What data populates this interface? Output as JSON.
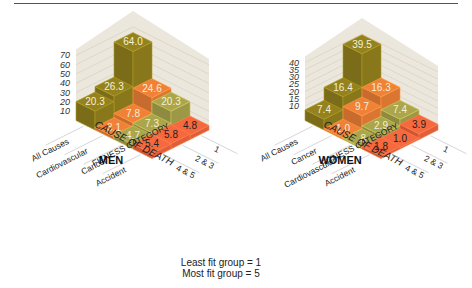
{
  "legend": {
    "line1": "Least fit group = 1",
    "line2": "Most fit group = 5"
  },
  "colors": {
    "backdrop": "#ece7dc",
    "grid": "#d9d2c4",
    "all_causes": "#8c7b1c",
    "cardiovascular": "#e27a34",
    "cancer": "#a19d48",
    "accident": "#e8623a",
    "label_light": "#f4efd8",
    "label_dark": "#222222"
  },
  "chart_data": [
    {
      "type": "bar",
      "subtype": "3d-isometric",
      "title": "MEN",
      "xlabel": "CAUSE OF DEATH",
      "ylabel": "FITNESS CATEGORY",
      "zlabel": "",
      "categories": [
        "All Causes",
        "Cardiovascular",
        "Cancer",
        "Accident"
      ],
      "fitness_categories": [
        "1",
        "2 & 3",
        "4 & 5"
      ],
      "z_ticks": [
        10,
        20,
        30,
        40,
        50,
        60,
        70
      ],
      "zlim": [
        0,
        70
      ],
      "series": [
        {
          "name": "1",
          "values": [
            64.0,
            24.6,
            20.3,
            4.8
          ]
        },
        {
          "name": "2 & 3",
          "values": [
            26.3,
            7.8,
            7.3,
            5.8
          ]
        },
        {
          "name": "4 & 5",
          "values": [
            20.3,
            3.1,
            4.7,
            5.4
          ]
        }
      ]
    },
    {
      "type": "bar",
      "subtype": "3d-isometric",
      "title": "WOMEN",
      "xlabel": "CAUSE OF DEATH",
      "ylabel": "FITNESS CATEGORY",
      "zlabel": "",
      "categories": [
        "All Causes",
        "Cancer",
        "Cardiovascular",
        "Accident"
      ],
      "fitness_categories": [
        "1",
        "2 & 3",
        "4 & 5"
      ],
      "z_ticks": [
        10,
        15,
        20,
        25,
        30,
        35,
        40
      ],
      "zlim": [
        0,
        40
      ],
      "series": [
        {
          "name": "1",
          "values": [
            39.5,
            16.3,
            7.4,
            3.9
          ]
        },
        {
          "name": "2 & 3",
          "values": [
            16.4,
            9.7,
            2.9,
            1.0
          ]
        },
        {
          "name": "4 & 5",
          "values": [
            7.4,
            1.0,
            0.8,
            1.8
          ]
        }
      ]
    }
  ],
  "value_labels": {
    "men": [
      [
        "64.0",
        "24.6",
        "20.3",
        "4.8"
      ],
      [
        "26.3",
        "7.8",
        "7.3",
        "5.8"
      ],
      [
        "20.3",
        "3.1",
        "4.7",
        "5.4"
      ]
    ],
    "women": [
      [
        "39.5",
        "16.3",
        "7.4",
        "3.9"
      ],
      [
        "16.4",
        "9.7",
        "2.9",
        "1.0"
      ],
      [
        "7.4",
        "1.0",
        ".8",
        "1.8"
      ]
    ]
  }
}
